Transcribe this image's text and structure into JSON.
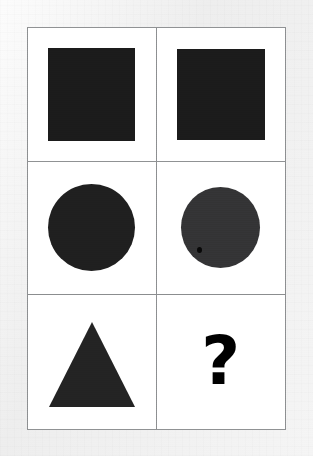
{
  "image": {
    "kind": "visual-analogy-puzzle",
    "width": 313,
    "height": 456,
    "background_color": "#eeeeee",
    "card_background_color": "#ffffff",
    "grid_line_color": "#8d8f91",
    "shape_fill_color": "#1b1b1b"
  },
  "puzzle": {
    "rows": 3,
    "columns": 2,
    "cells": [
      {
        "position": "row1-col1",
        "shape": "square",
        "label": "black square",
        "size": "large",
        "fill": "#1b1b1b"
      },
      {
        "position": "row1-col2",
        "shape": "square",
        "label": "black square",
        "size": "large",
        "fill": "#1b1b1b"
      },
      {
        "position": "row2-col1",
        "shape": "circle",
        "label": "black circle",
        "size": "large",
        "fill": "#1f1f1f"
      },
      {
        "position": "row2-col2",
        "shape": "circle",
        "label": "black circle",
        "size": "large",
        "fill": "#333335"
      },
      {
        "position": "row3-col1",
        "shape": "triangle",
        "label": "black triangle",
        "size": "large",
        "fill": "#232323"
      },
      {
        "position": "row3-col2",
        "shape": "question-mark",
        "label": "?",
        "size": "large",
        "fill": "#000000"
      }
    ],
    "answer_cell": {
      "position": "row3-col2",
      "glyph": "?"
    }
  }
}
